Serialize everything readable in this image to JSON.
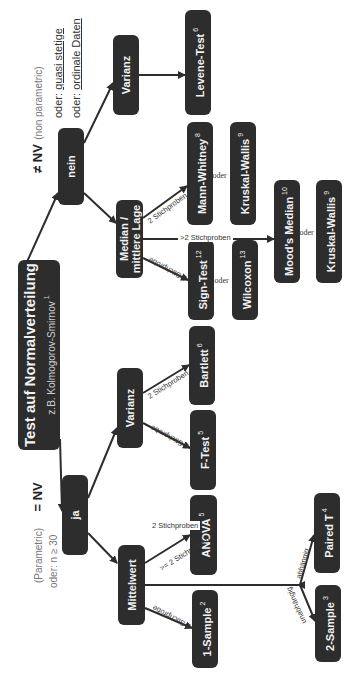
{
  "root": {
    "title": "Test auf Normalverteilung",
    "subtitle": "z.B. Kolmogorov-Smirnov",
    "ref": "1"
  },
  "branches": {
    "yes": {
      "label": "ja",
      "heading_symbol": "= NV",
      "heading_note": "(Parametric)",
      "sub_note": "oder: n ≥ 30"
    },
    "no": {
      "label": "nein",
      "heading_symbol": "≠ NV",
      "heading_note": "(non parametric)",
      "alt1_prefix": "oder: ",
      "alt1": "quasi stetige",
      "alt2_prefix": "oder: ",
      "alt2": "ordinale Daten"
    }
  },
  "nodes": {
    "mittelwert": "Mittelwert",
    "varianz_ja": "Varianz",
    "median": "Median / mittlere Lage",
    "median_l1": "Median /",
    "median_l2": "mittlere Lage",
    "varianz_nein": "Varianz",
    "one_sample": {
      "label": "1-Sample",
      "ref": "2"
    },
    "two_sample": {
      "label": "2-Sample",
      "ref": "3"
    },
    "paired_t": {
      "label": "Paired T",
      "ref": "4"
    },
    "anova": {
      "label": "ANOVA",
      "ref": "5"
    },
    "f_test": {
      "label": "F-Test",
      "ref": "5"
    },
    "bartlett": {
      "label": "Bartlett",
      "ref": "6"
    },
    "sign_test": {
      "label": "Sign-Test",
      "ref": "12"
    },
    "wilcoxon": {
      "label": "Wilcoxon",
      "ref": "13"
    },
    "mann_whitney": {
      "label": "Mann-Whitney",
      "ref": "8"
    },
    "kruskal_wallis_1": {
      "label": "Kruskal-Wallis",
      "ref": "9"
    },
    "levene": {
      "label": "Levene-Test",
      "ref": "6"
    },
    "moods_median": {
      "label": "Mood's Median",
      "ref": "10"
    },
    "kruskal_wallis_2": {
      "label": "Kruskal-Wallis",
      "ref": "9"
    }
  },
  "edge_labels": {
    "one_stichprobe": "1 Stichprobe",
    "two_stichproben": "2 Stichproben",
    "ge2_stichproben_l1": ">= 2",
    "ge2_stichproben_l2": "Stichproben",
    "gt2_stichproben": ">2 Stichproben",
    "abhaengig": "abhängig",
    "unabhaengig": "unabhängig",
    "oder": "oder"
  }
}
